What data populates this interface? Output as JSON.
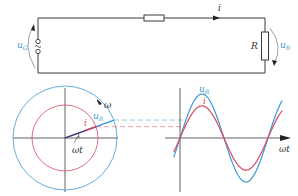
{
  "colors": {
    "wire": "#3a3a3a",
    "blue": "#3b9ad6",
    "red": "#d9475f",
    "label_blue": "#3b9ad6",
    "label_dark": "#333333"
  },
  "circuit": {
    "source_label": "u",
    "source_sub": "G",
    "source_symbol": "~",
    "current_label": "i",
    "resistor_label": "R",
    "voltage_label": "u",
    "voltage_sub": "R"
  },
  "phasor": {
    "angular_velocity_label": "ω",
    "angle_label": "ωt",
    "voltage_label": "u",
    "voltage_sub": "R",
    "current_label": "i",
    "angle_deg": 20
  },
  "waveform": {
    "x_axis_label": "ωt",
    "voltage_label": "u",
    "voltage_sub": "R",
    "current_label": "i"
  },
  "chart_data": {
    "type": "line",
    "title": "",
    "xlabel": "ωt",
    "ylabel": "",
    "series": [
      {
        "name": "u_R",
        "color": "#3b9ad6",
        "function": "sin",
        "amplitude": 1.0,
        "phase_deg": 0
      },
      {
        "name": "i",
        "color": "#d9475f",
        "function": "sin",
        "amplitude": 0.73,
        "phase_deg": 0
      }
    ],
    "x_range_rad": [
      -0.45,
      7.3
    ],
    "grid": false,
    "legend": "inline labels"
  }
}
